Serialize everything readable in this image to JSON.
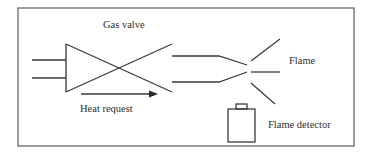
{
  "diagram": {
    "labels": {
      "gas_valve": "Gas valve",
      "heat_request": "Heat request",
      "flame": "Flame",
      "flame_detector": "Flame detector"
    },
    "colors": {
      "line": "#3a3a3a",
      "frame": "#5a5a5a",
      "text": "#2e2e2e",
      "background": "#ffffff"
    },
    "components": [
      {
        "id": "gas-inlet",
        "type": "pipe-pair"
      },
      {
        "id": "gas-valve",
        "type": "valve-symbol"
      },
      {
        "id": "burner-nozzle",
        "type": "converging-pipe"
      },
      {
        "id": "flame",
        "type": "radiating-lines"
      },
      {
        "id": "flame-detector",
        "type": "sensor"
      },
      {
        "id": "heat-request",
        "type": "arrow"
      }
    ]
  }
}
